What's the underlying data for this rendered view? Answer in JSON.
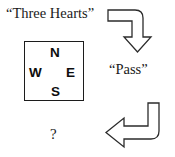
{
  "figure": {
    "type": "bidding-sequence-diagram",
    "background_color": "#ffffff",
    "stroke_color": "#2b2b2b",
    "text_color": "#1a1a1a"
  },
  "utterances": {
    "first": "“Three Hearts”",
    "second": "“Pass”",
    "unknown": "?"
  },
  "compass": {
    "north": "N",
    "west": "W",
    "east": "E",
    "south": "S",
    "border_color": "#1c1c1c"
  },
  "arrows": {
    "top": {
      "label": "right-then-down-elbow-arrow",
      "direction": "down",
      "enters_from": "left"
    },
    "bottom": {
      "label": "down-then-left-elbow-arrow",
      "direction": "left",
      "enters_from": "top"
    }
  }
}
